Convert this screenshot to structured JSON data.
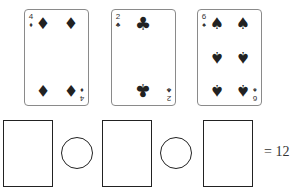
{
  "cards": [
    {
      "rank": "4",
      "suit": "diamonds",
      "suit_glyph": "♦",
      "left": 24
    },
    {
      "rank": "2",
      "suit": "clubs",
      "suit_glyph": "♣",
      "left": 111
    },
    {
      "rank": "6",
      "suit": "spades",
      "suit_glyph": "♠",
      "left": 197
    }
  ],
  "equation": {
    "slots": 3,
    "operators": 2,
    "equals": "= 12",
    "target": 12
  },
  "colors": {
    "ink": "#222222",
    "card_border": "#8a8a8a",
    "background": "#ffffff"
  }
}
